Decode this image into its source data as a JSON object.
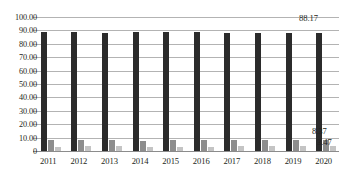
{
  "chart_data": {
    "type": "bar",
    "title": "",
    "subtitle": "",
    "xlabel": "",
    "ylabel": "",
    "ylim": [
      0,
      100
    ],
    "ytick_values": [
      100,
      90,
      80,
      70,
      60,
      50,
      40,
      30,
      20,
      10,
      0
    ],
    "ytick_labels": [
      "100.00",
      "90.00",
      "80.00",
      "70.00",
      "60.00",
      "50.00",
      "40.00",
      "30.00",
      "20.00",
      "10.00",
      "0"
    ],
    "grid": true,
    "legend": false,
    "legend_position": "none",
    "categories": [
      "2011",
      "2012",
      "2013",
      "2014",
      "2015",
      "2016",
      "2017",
      "2018",
      "2019",
      "2020"
    ],
    "series": [
      {
        "name": "series-1",
        "color": "#2b2b2b",
        "values": [
          88.6,
          88.6,
          87.9,
          88.9,
          88.6,
          88.7,
          88.3,
          88.1,
          87.7,
          88.17
        ]
      },
      {
        "name": "series-2",
        "color": "#8d8d8d",
        "values": [
          7.9,
          8.0,
          8.4,
          7.8,
          8.0,
          8.0,
          8.4,
          8.2,
          8.5,
          8.37
        ]
      },
      {
        "name": "series-3",
        "color": "#c4c4c4",
        "values": [
          3.0,
          3.4,
          3.6,
          3.1,
          3.3,
          3.3,
          3.6,
          3.6,
          3.8,
          3.47
        ]
      }
    ],
    "annotations": [
      {
        "name": "value-label-series-1-2020",
        "text": "88.17",
        "series": "series-1",
        "category": "2020"
      },
      {
        "name": "value-label-series-2-2020",
        "text": "8.37",
        "series": "series-2",
        "category": "2020"
      },
      {
        "name": "value-label-series-3-2020",
        "text": "3.47",
        "series": "series-3",
        "category": "2020"
      }
    ]
  }
}
